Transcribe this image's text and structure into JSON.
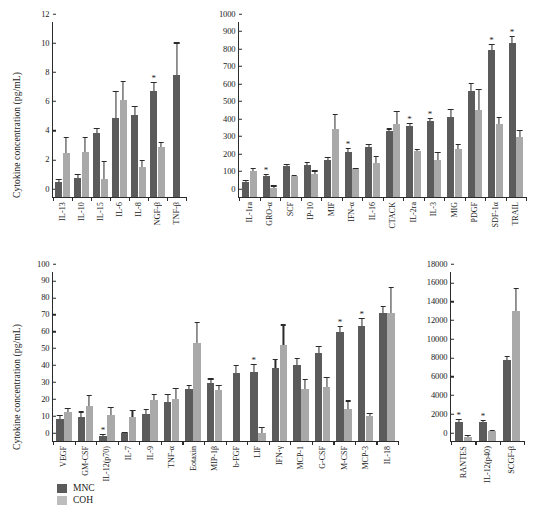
{
  "figure": {
    "legend": {
      "series": [
        {
          "key": "MNC",
          "label": "MNC",
          "color": "#5b5b5b"
        },
        {
          "key": "COH",
          "label": "COH",
          "color": "#bdbdbd"
        }
      ]
    },
    "significance_marker": "*"
  },
  "chart_data": [
    {
      "id": "panel-top-left",
      "type": "bar",
      "title": "",
      "xlabel": "",
      "ylabel": "Cytokine concentration (pg/mL)",
      "ylim": [
        0,
        12
      ],
      "yticks": [
        0,
        2,
        4,
        6,
        8,
        10,
        12
      ],
      "grid": false,
      "legend_position": "external-bottom-left",
      "categories": [
        "IL-13",
        "IL-10",
        "IL-15",
        "IL-6",
        "IL-8",
        "NGF-β",
        "TNF-β"
      ],
      "series": [
        {
          "name": "MNC",
          "color": "#5b5b5b",
          "values": [
            1.0,
            1.3,
            4.4,
            5.4,
            5.65,
            7.3,
            8.4
          ],
          "errors": [
            0.25,
            0.3,
            0.35,
            1.9,
            0.6,
            0.6,
            2.2
          ],
          "significant": [
            false,
            false,
            false,
            false,
            false,
            true,
            false
          ]
        },
        {
          "name": "COH",
          "color": "#a9a9a9",
          "values": [
            3.05,
            3.1,
            1.25,
            6.65,
            2.05,
            3.45,
            null
          ],
          "errors": [
            1.1,
            1.0,
            1.25,
            1.3,
            0.5,
            0.35,
            null
          ],
          "significant": [
            false,
            false,
            false,
            false,
            false,
            false,
            false
          ]
        }
      ]
    },
    {
      "id": "panel-top-right",
      "type": "bar",
      "title": "",
      "xlabel": "",
      "ylabel": "",
      "ylim": [
        0,
        1000
      ],
      "yticks": [
        0,
        100,
        200,
        300,
        400,
        500,
        600,
        700,
        800,
        900,
        1000
      ],
      "grid": false,
      "categories": [
        "IL-1ra",
        "GRO-α",
        "SCF",
        "IP-10",
        "MIF",
        "IFN-α",
        "IL-16",
        "CTACK",
        "IL-2ra",
        "IL-3",
        "MIG",
        "PDGF",
        "SDF-1α",
        "TRAIL"
      ],
      "series": [
        {
          "name": "MNC",
          "color": "#5b5b5b",
          "values": [
            88,
            120,
            178,
            182,
            210,
            258,
            285,
            380,
            405,
            432,
            460,
            608,
            840,
            882
          ],
          "errors": [
            12,
            14,
            10,
            20,
            18,
            20,
            16,
            12,
            18,
            22,
            45,
            42,
            35,
            38
          ],
          "significant": [
            false,
            true,
            false,
            false,
            false,
            true,
            false,
            false,
            true,
            true,
            false,
            false,
            true,
            true
          ]
        },
        {
          "name": "COH",
          "color": "#a9a9a9",
          "values": [
            148,
            52,
            118,
            132,
            388,
            158,
            195,
            420,
            262,
            212,
            272,
            497,
            415,
            342
          ],
          "errors": [
            18,
            14,
            10,
            20,
            88,
            10,
            42,
            72,
            12,
            45,
            32,
            118,
            42,
            40
          ],
          "significant": [
            false,
            false,
            false,
            false,
            false,
            false,
            false,
            false,
            false,
            false,
            false,
            false,
            false,
            false
          ]
        }
      ]
    },
    {
      "id": "panel-bottom-left",
      "type": "bar",
      "title": "",
      "xlabel": "",
      "ylabel": "Cytokine concentration (pg/mL)",
      "ylim": [
        0,
        100
      ],
      "yticks": [
        0,
        10,
        20,
        30,
        40,
        50,
        60,
        70,
        80,
        90,
        100
      ],
      "grid": false,
      "categories": [
        "VEGF",
        "GM-CSF",
        "IL-12(p70)",
        "IL-7",
        "IL-9",
        "TNF-α",
        "Eotaxin",
        "MIP-1β",
        "b-FGF",
        "LIF",
        "IFN-γ",
        "MCP-1",
        "G-CSF",
        "M-CSF",
        "MCP-3",
        "IL-18"
      ],
      "series": [
        {
          "name": "MNC",
          "color": "#5b5b5b",
          "values": [
            13,
            14,
            3,
            4.5,
            16,
            23,
            31,
            34.5,
            40,
            41,
            43,
            45,
            52,
            64.5,
            68,
            76
          ],
          "errors": [
            2.5,
            3.5,
            1.0,
            1.0,
            3.0,
            5.0,
            2.0,
            2.5,
            5.0,
            4.5,
            5.5,
            4.0,
            4.0,
            3.5,
            5.0,
            4.0
          ],
          "significant": [
            false,
            false,
            true,
            false,
            false,
            false,
            false,
            false,
            false,
            true,
            false,
            false,
            false,
            true,
            true,
            false
          ]
        },
        {
          "name": "COH",
          "color": "#a9a9a9",
          "values": [
            17,
            20.5,
            15.5,
            14.5,
            24,
            25,
            58,
            30,
            null,
            5,
            57,
            31,
            32,
            19,
            15,
            76
          ],
          "errors": [
            2.5,
            7.0,
            4.5,
            4.0,
            4.0,
            6.5,
            12.5,
            3.0,
            null,
            3.5,
            12.0,
            6.0,
            6.0,
            5.0,
            1.5,
            15.0
          ],
          "significant": [
            false,
            false,
            false,
            false,
            false,
            false,
            false,
            false,
            false,
            false,
            false,
            false,
            false,
            false,
            false,
            false
          ]
        }
      ]
    },
    {
      "id": "panel-bottom-right",
      "type": "bar",
      "title": "",
      "xlabel": "",
      "ylabel": "",
      "ylim": [
        0,
        18000
      ],
      "yticks": [
        0,
        2000,
        4000,
        6000,
        8000,
        10000,
        12000,
        14000,
        16000,
        18000
      ],
      "grid": false,
      "categories": [
        "RANTES",
        "IL-12(p40)",
        "SCGF-β"
      ],
      "series": [
        {
          "name": "MNC",
          "color": "#5b5b5b",
          "values": [
            2050,
            2050,
            8600
          ],
          "errors": [
            300,
            150,
            500
          ],
          "significant": [
            true,
            true,
            false
          ]
        },
        {
          "name": "COH",
          "color": "#a9a9a9",
          "values": [
            480,
            1050,
            13800
          ],
          "errors": [
            180,
            120,
            2500
          ],
          "significant": [
            false,
            false,
            false
          ]
        }
      ]
    }
  ]
}
